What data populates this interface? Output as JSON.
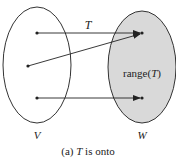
{
  "diagram": {
    "domain_set_label": "V",
    "codomain_set_label": "W",
    "mapping_label": "T",
    "range_label_prefix": "range(",
    "range_label_var": "T",
    "range_label_suffix": ")",
    "caption_prefix": "(a) ",
    "caption_var": "T",
    "caption_suffix": " is onto",
    "colors": {
      "codomain_fill": "#d9d9d9",
      "stroke": "#333333"
    }
  }
}
